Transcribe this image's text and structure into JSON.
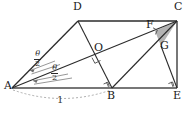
{
  "figure": {
    "type": "geometry-diagram",
    "width": 193,
    "height": 114,
    "background_color": "#ffffff",
    "stroke_color": "#2b2b2b",
    "shade_color": "#b3b3b3",
    "dashed_color": "#9a9a9a"
  },
  "vertices": [
    {
      "id": "A",
      "label": "A",
      "x": 12,
      "y": 88,
      "label_x": 4,
      "label_y": 84
    },
    {
      "id": "B",
      "label": "B",
      "x": 112,
      "y": 88,
      "label_x": 108,
      "label_y": 91
    },
    {
      "id": "C",
      "label": "C",
      "x": 177,
      "y": 21,
      "label_x": 176,
      "label_y": 3
    },
    {
      "id": "D",
      "label": "D",
      "x": 78,
      "y": 21,
      "label_x": 74,
      "label_y": 3
    },
    {
      "id": "E",
      "label": "E",
      "x": 177,
      "y": 88,
      "label_x": 174,
      "label_y": 91
    },
    {
      "id": "F",
      "label": "F",
      "x": 155,
      "y": 31,
      "label_x": 148,
      "label_y": 22
    },
    {
      "id": "G",
      "label": "G",
      "x": 161,
      "y": 46,
      "label_x": 161,
      "label_y": 42
    },
    {
      "id": "O",
      "label": "O",
      "x": 98,
      "y": 54,
      "label_x": 96,
      "label_y": 45
    }
  ],
  "segments": [
    {
      "name": "A-D",
      "from": "A",
      "to": "D"
    },
    {
      "name": "D-C",
      "from": "D",
      "to": "C"
    },
    {
      "name": "A-B",
      "from": "A",
      "to": "B"
    },
    {
      "name": "B-E",
      "from": "B",
      "to": "E"
    },
    {
      "name": "C-E",
      "from": "C",
      "to": "E"
    },
    {
      "name": "A-C",
      "from": "A",
      "to": "C"
    },
    {
      "name": "D-B",
      "from": "D",
      "to": "B"
    },
    {
      "name": "B-C",
      "from": "B",
      "to": "C"
    },
    {
      "name": "G-E",
      "from": "G",
      "to": "E"
    }
  ],
  "shaded_region": {
    "name": "triangle-FGC",
    "vertices": [
      "F",
      "G",
      "C"
    ],
    "fill": "#b3b3b3"
  },
  "right_angles": [
    {
      "name": "right-angle-at-O",
      "at": "O"
    },
    {
      "name": "right-angle-at-F",
      "at": "F"
    },
    {
      "name": "right-angle-at-B",
      "at": "B"
    },
    {
      "name": "right-angle-at-E",
      "at": "E"
    }
  ],
  "angle_labels": [
    {
      "name": "angle-theta-over-two-upper",
      "numerator": "θ",
      "denominator": "2",
      "x": 36,
      "y": 54
    },
    {
      "name": "angle-theta-over-two-lower",
      "numerator": "θ",
      "denominator": "2",
      "x": 53,
      "y": 68
    }
  ],
  "measures": [
    {
      "name": "length-one",
      "label": "1",
      "from": "A",
      "to": "B",
      "style": "dashed-arc",
      "x": 60,
      "y": 98
    }
  ]
}
